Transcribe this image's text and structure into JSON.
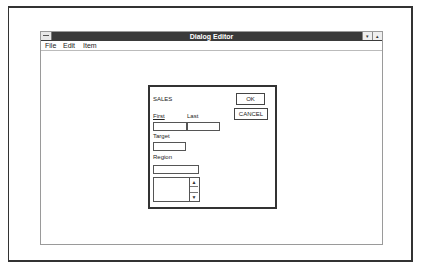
{
  "window": {
    "title": "Dialog Editor",
    "controls": {
      "minimize": "▾",
      "maximize": "▴"
    }
  },
  "menubar": {
    "items": [
      {
        "label": "File",
        "mnemonic": "F"
      },
      {
        "label": "Edit",
        "mnemonic": "E"
      },
      {
        "label": "Item",
        "mnemonic": "I"
      }
    ]
  },
  "dialog": {
    "title": "SALES",
    "ok_label": "OK",
    "cancel_label": "CANCEL",
    "fields": {
      "first_label": "First",
      "last_label": "Last",
      "target_label": "Target",
      "region_label": "Region",
      "first_value": "",
      "last_value": "",
      "target_value": "",
      "region_value": ""
    },
    "list": {
      "items": [],
      "scroll_up": "▲",
      "scroll_down": "▼"
    }
  }
}
